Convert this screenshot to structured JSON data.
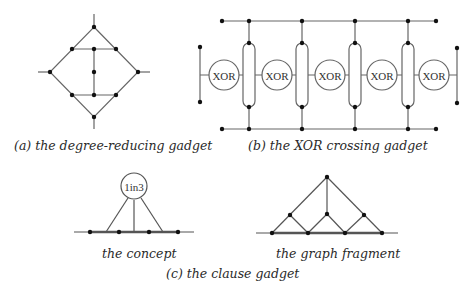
{
  "captions": {
    "a": "(a) the degree-reducing gadget",
    "b": "(b) the XOR crossing gadget",
    "c_concept": "the concept",
    "c_fragment": "the graph fragment",
    "c": "(c) the clause gadget"
  },
  "xor_gadget": {
    "node_label": "XOR",
    "count": 5
  },
  "clause_gadget": {
    "node_label": "1in3"
  },
  "colors": {
    "line": "#555555",
    "node": "#111111",
    "text": "#2a2a2a"
  }
}
